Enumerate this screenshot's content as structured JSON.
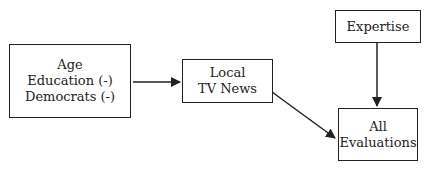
{
  "diagram": {
    "nodes": [
      {
        "id": "predictors",
        "lines": [
          "Age",
          "Education (-)",
          "Democrats (-)"
        ]
      },
      {
        "id": "local_tv_news",
        "lines": [
          "Local",
          "TV News"
        ]
      },
      {
        "id": "expertise",
        "lines": [
          "Expertise"
        ]
      },
      {
        "id": "all_evaluations",
        "lines": [
          "All",
          "Evaluations"
        ]
      }
    ],
    "edges": [
      {
        "from": "predictors",
        "to": "local_tv_news"
      },
      {
        "from": "local_tv_news",
        "to": "all_evaluations"
      },
      {
        "from": "expertise",
        "to": "all_evaluations"
      }
    ],
    "colors": {
      "line": "#222222",
      "background": "#ffffff"
    }
  }
}
